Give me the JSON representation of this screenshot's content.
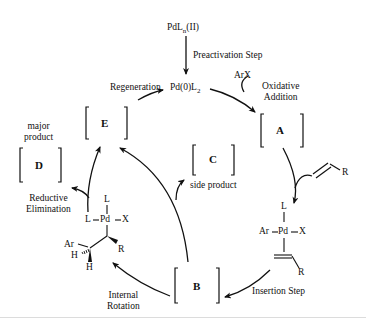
{
  "diagram": {
    "type": "catalytic-cycle",
    "precatalyst": {
      "prefix": "PdL",
      "subscript": "n",
      "suffix": "(II)"
    },
    "active_catalyst": {
      "prefix": "Pd(0)L",
      "subscript": "2"
    },
    "reagents": {
      "aryl_halide": "ArX",
      "alkene_substituent": "R"
    },
    "steps": {
      "preactivation": "Preactivation Step",
      "oxidative_addition_line1": "Oxidative",
      "oxidative_addition_line2": "Addition",
      "insertion": "Insertion Step",
      "internal_rotation_line1": "Internal",
      "internal_rotation_line2": "Rotation",
      "reductive_elimination_line1": "Reductive",
      "reductive_elimination_line2": "Elimination",
      "regeneration": "Regeneration"
    },
    "intermediates": {
      "A": "A",
      "B": "B",
      "C": "C",
      "D": "D",
      "E": "E"
    },
    "annotations": {
      "side_product": "side product",
      "major_product_line1": "major",
      "major_product_line2": "product"
    },
    "complex_pi": {
      "top": "L",
      "left": "Ar",
      "center": "Pd",
      "right": "X",
      "alkene_R": "R"
    },
    "complex_sigma": {
      "top": "L",
      "left": "L",
      "center": "Pd",
      "right": "X",
      "ar": "Ar",
      "h1": "H",
      "h2": "H",
      "r": "R"
    },
    "colors": {
      "line": "#111111",
      "background": "#ffffff"
    }
  }
}
